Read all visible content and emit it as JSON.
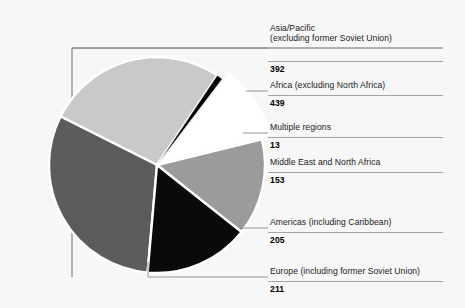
{
  "chart_data": {
    "type": "pie",
    "title": "",
    "subtitle": "",
    "xlabel": "",
    "ylabel": "",
    "legend_position": "callout-labels-right",
    "grid": false,
    "total": 1413,
    "categories": [
      "Asia/Pacific (excluding former Soviet Union)",
      "Africa (excluding North Africa)",
      "Multiple regions",
      "Middle East and North Africa",
      "Americas (including Caribbean)",
      "Europe (including former Soviet Union)"
    ],
    "values": [
      392,
      439,
      13,
      153,
      205,
      211
    ],
    "slices": [
      {
        "label_line1": "Asia/Pacific",
        "label_line2": "(excluding former Soviet Union)",
        "value": 392,
        "color": "#c9c9c9",
        "start_angle": -66.0,
        "end_angle": 33.9,
        "exploded": false
      },
      {
        "label_line1": "Africa (excluding North Africa)",
        "label_line2": "",
        "value": 439,
        "color": "#5c5c5c",
        "start_angle": 185.0,
        "end_angle": 296.8,
        "exploded": false
      },
      {
        "label_line1": "Multiple regions",
        "label_line2": "",
        "value": 13,
        "color": "#000000",
        "start_angle": 33.9,
        "end_angle": 37.2,
        "exploded": false
      },
      {
        "label_line1": "Middle East and North Africa",
        "label_line2": "",
        "value": 153,
        "color": "#ffffff",
        "start_angle": 37.2,
        "end_angle": 76.2,
        "exploded": true
      },
      {
        "label_line1": "Americas (including Caribbean)",
        "label_line2": "",
        "value": 205,
        "color": "#9b9b9b",
        "start_angle": 76.2,
        "end_angle": 128.4,
        "exploded": false
      },
      {
        "label_line1": "Europe (including former Soviet Union)",
        "label_line2": "",
        "value": 211,
        "color": "#0a0a0a",
        "start_angle": 128.4,
        "end_angle": 185.0,
        "exploded": false
      }
    ]
  },
  "callouts": [
    {
      "line1": "Asia/Pacific",
      "line2": "(excluding former Soviet Union)",
      "value": "392"
    },
    {
      "line1": "Africa (excluding North Africa)",
      "line2": "",
      "value": "439"
    },
    {
      "line1": "Multiple regions",
      "line2": "",
      "value": "13"
    },
    {
      "line1": "Middle East and North Africa",
      "line2": "",
      "value": "153"
    },
    {
      "line1": "Americas (including Caribbean)",
      "line2": "",
      "value": "205"
    },
    {
      "line1": "Europe (including former Soviet Union)",
      "line2": "",
      "value": "211"
    }
  ],
  "colors": {
    "background": "#f7f7f7",
    "frame": "#6b6b6b",
    "leader": "#7a7a7a",
    "text": "#1a1a1a",
    "asia_pacific": "#c9c9c9",
    "africa": "#5c5c5c",
    "multiple_regions": "#000000",
    "middle_east": "#ffffff",
    "americas": "#9b9b9b",
    "europe": "#0a0a0a"
  }
}
